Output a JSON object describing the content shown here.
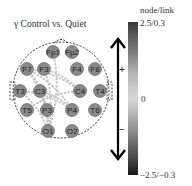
{
  "title": "γ Control vs. Quiet",
  "colorbar": {
    "label": "node/link",
    "max_label": "2.5/0.3",
    "mid_label": "0",
    "min_label": "−2.5/−0.3",
    "colors": {
      "top": "#3a3a3a",
      "middle": "#d8d8d8",
      "bottom": "#1a1a1a"
    }
  },
  "arrow": {
    "plus": "+",
    "minus": "−"
  },
  "nodes": [
    {
      "id": "Fp1",
      "x": 53,
      "y": 52
    },
    {
      "id": "Fp2",
      "x": 72,
      "y": 52
    },
    {
      "id": "F7",
      "x": 27,
      "y": 69
    },
    {
      "id": "F3",
      "x": 44,
      "y": 69
    },
    {
      "id": "F4",
      "x": 77,
      "y": 69
    },
    {
      "id": "F8",
      "x": 95,
      "y": 69
    },
    {
      "id": "T3",
      "x": 20,
      "y": 91
    },
    {
      "id": "C3",
      "x": 40,
      "y": 91
    },
    {
      "id": "C4",
      "x": 80,
      "y": 91
    },
    {
      "id": "T4",
      "x": 100,
      "y": 91
    },
    {
      "id": "T5",
      "x": 27,
      "y": 110
    },
    {
      "id": "P3",
      "x": 47,
      "y": 110
    },
    {
      "id": "P4",
      "x": 72,
      "y": 110
    },
    {
      "id": "T6",
      "x": 95,
      "y": 110
    },
    {
      "id": "O1",
      "x": 48,
      "y": 131
    },
    {
      "id": "O2",
      "x": 72,
      "y": 131
    }
  ],
  "links": [
    [
      "F7",
      "C4"
    ],
    [
      "F7",
      "P3"
    ],
    [
      "F7",
      "O1"
    ],
    [
      "F3",
      "O1"
    ],
    [
      "Fp1",
      "O1"
    ],
    [
      "F7",
      "P4"
    ],
    [
      "T3",
      "P4"
    ],
    [
      "C3",
      "P4"
    ],
    [
      "T3",
      "O1"
    ],
    [
      "F3",
      "C4"
    ],
    [
      "C3",
      "O1"
    ],
    [
      "T5",
      "C4"
    ]
  ]
}
